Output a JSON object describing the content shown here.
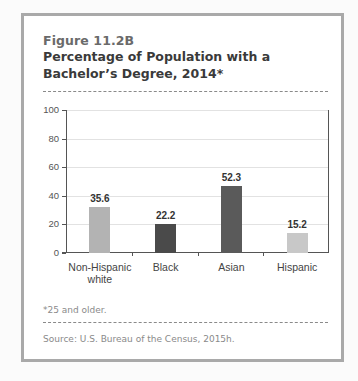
{
  "figure": {
    "number": "Figure 11.2B",
    "title": "Percentage of Population with a Bachelor’s Degree, 2014*",
    "footnote": "*25 and older.",
    "source": "Source: U.S. Bureau of the Census, 2015h."
  },
  "chart_data": {
    "type": "bar",
    "title": "Percentage of Population with a Bachelor’s Degree, 2014*",
    "categories": [
      "Non-Hispanic white",
      "Black",
      "Asian",
      "Hispanic"
    ],
    "values": [
      35.6,
      22.2,
      52.3,
      15.2
    ],
    "data_labels": [
      "35.6",
      "22.2",
      "52.3",
      "15.2"
    ],
    "bar_colors": [
      "#b3b3b3",
      "#4a4a4a",
      "#5a5a5a",
      "#c8c8c8"
    ],
    "xlabel": "",
    "ylabel": "",
    "ylim": [
      0,
      100
    ],
    "yticks": [
      0,
      20,
      40,
      60,
      80,
      100
    ],
    "grid": true,
    "legend": null
  },
  "axis": {
    "yticks": [
      "0",
      "20",
      "40",
      "60",
      "80",
      "100"
    ]
  },
  "bars": [
    {
      "label": "Non-Hispanic white",
      "value_label": "35.6"
    },
    {
      "label": "Black",
      "value_label": "22.2"
    },
    {
      "label": "Asian",
      "value_label": "52.3"
    },
    {
      "label": "Hispanic",
      "value_label": "15.2"
    }
  ]
}
